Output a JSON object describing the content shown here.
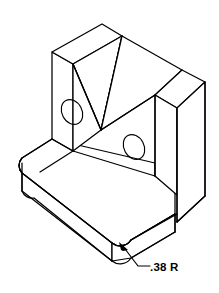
{
  "drawing": {
    "title": "Isometric pictorial of V-block bracket",
    "type": "isometric-technical-drawing",
    "background_color": "#ffffff",
    "line_color": "#000000",
    "annotations": [
      {
        "id": "base-corner-radius",
        "label": ".38 R",
        "meaning": "0.38 inch fillet radius on base corner",
        "leader_target_x": 120,
        "leader_target_y": 243,
        "text_x": 150,
        "text_y": 270
      }
    ],
    "features": {
      "holes": [
        {
          "name": "left-wall-hole",
          "cx": 72,
          "cy": 112,
          "rx": 10,
          "ry": 13,
          "rotation": -28
        },
        {
          "name": "right-wall-hole",
          "cx": 134,
          "cy": 147,
          "rx": 10,
          "ry": 13,
          "rotation": -28
        }
      ],
      "v_groove": {
        "name": "v-groove",
        "apex_x": 101,
        "apex_y": 130
      },
      "base_plate": {
        "name": "base-plate",
        "corner_radius": ".38 R"
      }
    }
  }
}
